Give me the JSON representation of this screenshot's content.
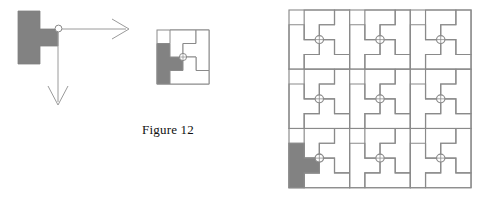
{
  "document": {
    "page_kind": "figure-illustration",
    "background_color": "#ffffff"
  },
  "caption": {
    "label": "Figure 12"
  },
  "palette": {
    "shaded_tile_fill": "#828282",
    "tile_outline": "#8a8a8a",
    "arrow_stroke": "#9a9a9a",
    "marker_stroke": "#8a8a8a",
    "caption_color": "#111111",
    "page_background": "#ffffff"
  },
  "panels": {
    "exploded": {
      "name": "exploded-tile-with-translation-arrows",
      "tile_fill": "#828282",
      "pivot_marker": {
        "shape": "circle",
        "radius": 3.2
      },
      "arrows": [
        {
          "name": "horizontal-translation-arrow",
          "direction": "right",
          "length": 68
        },
        {
          "name": "vertical-translation-arrow",
          "direction": "down",
          "length": 76
        }
      ]
    },
    "single": {
      "name": "single-pinwheel-tile-square",
      "square_size": 52,
      "pieces": 4,
      "shaded_piece_index": 0
    },
    "tiling": {
      "name": "three-by-three-pinwheel-tiling",
      "rows": 3,
      "columns": 3,
      "cell_count": 9,
      "shaded_cell": {
        "row": 3,
        "column": 1
      },
      "shaded_piece_index": 0
    }
  },
  "icons": {
    "pivot_marker": "circle-pivot-icon",
    "arrow_right": "arrow-right-icon",
    "arrow_down": "arrow-down-icon"
  }
}
